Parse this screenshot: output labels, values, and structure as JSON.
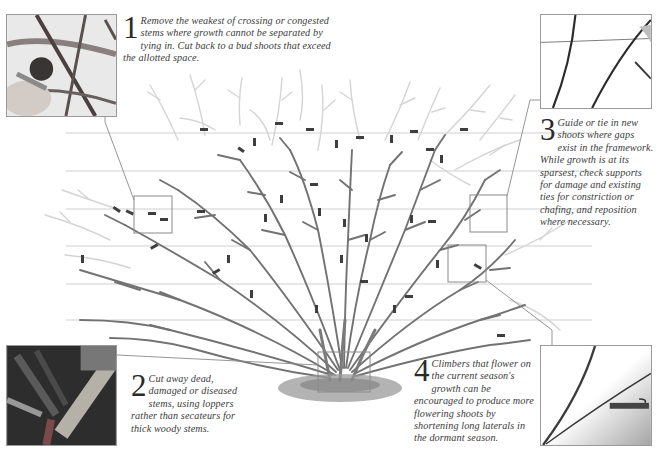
{
  "colors": {
    "wire": "#c8c8c8",
    "old_growth": "#6d6d6d",
    "new_growth": "#d2d2d2",
    "tie": "#3c3c3c",
    "callout_box": "#8a8a8a",
    "ground": "#8d8d8d",
    "text": "#3a3a3a"
  },
  "steps": [
    {
      "number": "1",
      "text": "Remove the weakest of crossing or congested stems where growth cannot be separated by tying in. Cut back to a bud shoots that exceed the allotted space.",
      "photo": "close-up of secateurs cutting crossing stems"
    },
    {
      "number": "2",
      "text": "Cut away dead, damaged or diseased stems, using loppers rather than secateurs for thick woody stems.",
      "photo": "loppers cutting thick woody stem at base"
    },
    {
      "number": "3",
      "text": "Guide or tie in new shoots where gaps exist in the framework. While growth is at its sparsest, check supports for damage and existing ties for constriction or chafing, and reposition where necessary.",
      "photo": "new shoots crossing a support wire"
    },
    {
      "number": "4",
      "text": "Climbers that flower on the current season's growth can be encouraged to produce more flowering shoots by shortening long laterals in the dormant season.",
      "photo": "lateral shoots tied to wire"
    }
  ],
  "diagram": {
    "wires_y": [
      133,
      171,
      209,
      246,
      284,
      320
    ],
    "wire_x_range": [
      66,
      592
    ],
    "callout_boxes": [
      {
        "id": "box-step-1",
        "x": 134,
        "y": 196,
        "w": 38,
        "h": 37
      },
      {
        "id": "box-step-3",
        "x": 470,
        "y": 195,
        "w": 37,
        "h": 37
      },
      {
        "id": "box-step-4",
        "x": 448,
        "y": 245,
        "w": 38,
        "h": 37
      },
      {
        "id": "box-step-2",
        "x": 318,
        "y": 352,
        "w": 52,
        "h": 40
      }
    ]
  }
}
